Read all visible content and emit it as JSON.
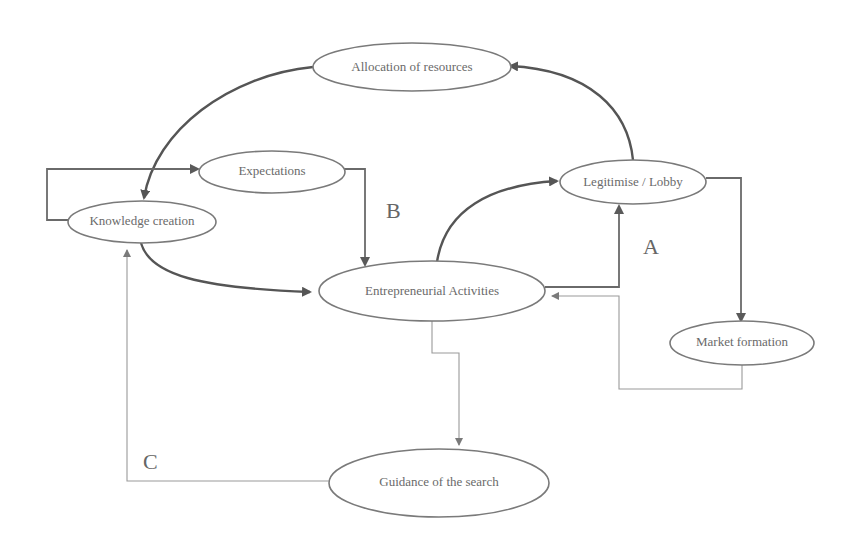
{
  "diagram": {
    "nodes": {
      "allocation": "Allocation of resources",
      "expectations": "Expectations",
      "knowledge": "Knowledge creation",
      "legitimise": "Legitimise / Lobby",
      "entrepreneurial": "Entrepreneurial Activities",
      "market": "Market formation",
      "guidance": "Guidance of the search"
    },
    "loop_labels": {
      "a": "A",
      "b": "B",
      "c": "C"
    },
    "edges": [
      {
        "from": "Legitimise / Lobby",
        "to": "Allocation of resources",
        "weight": "thick"
      },
      {
        "from": "Allocation of resources",
        "to": "Knowledge creation",
        "weight": "thick"
      },
      {
        "from": "Knowledge creation",
        "to": "Expectations",
        "weight": "medium"
      },
      {
        "from": "Expectations",
        "to": "Entrepreneurial Activities",
        "weight": "medium"
      },
      {
        "from": "Knowledge creation",
        "to": "Entrepreneurial Activities",
        "weight": "thick"
      },
      {
        "from": "Entrepreneurial Activities",
        "to": "Legitimise / Lobby",
        "weight": "thick",
        "loop": "B"
      },
      {
        "from": "Entrepreneurial Activities",
        "to": "Legitimise / Lobby",
        "weight": "medium",
        "loop": "A"
      },
      {
        "from": "Legitimise / Lobby",
        "to": "Market formation",
        "weight": "medium"
      },
      {
        "from": "Market formation",
        "to": "Entrepreneurial Activities",
        "weight": "thin"
      },
      {
        "from": "Entrepreneurial Activities",
        "to": "Guidance of the search",
        "weight": "thin"
      },
      {
        "from": "Guidance of the search",
        "to": "Knowledge creation",
        "weight": "thin",
        "loop": "C"
      }
    ]
  }
}
